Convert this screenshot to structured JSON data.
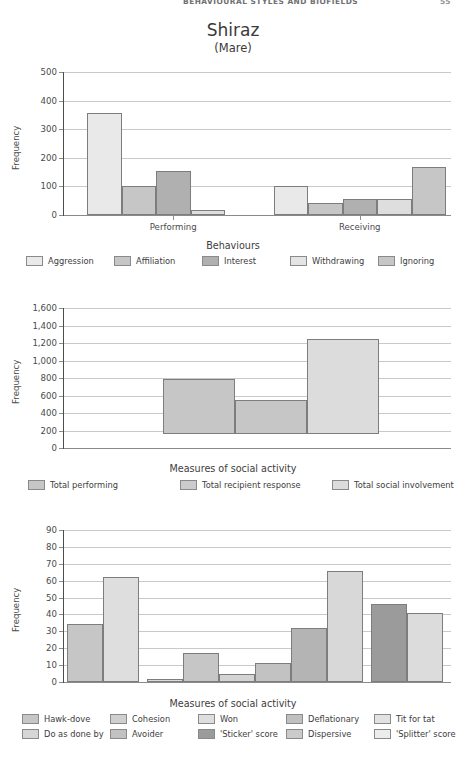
{
  "running_head": {
    "title": "BEHAVIOURAL STYLES AND BIOFIELDS",
    "page_number": "55"
  },
  "figure": {
    "title": "Shiraz",
    "subtitle": "(Mare)"
  },
  "palette": {
    "c1": "#e9e9e9",
    "c2": "#c6c6c6",
    "c3": "#b0b0b0",
    "c4": "#dedede",
    "c5": "#cfcfcf",
    "c6": "#9b9b9b",
    "axis": "#4d4d4d",
    "grid": "#c9c9c9"
  },
  "chart_data": [
    {
      "id": "chart-behaviours",
      "type": "bar",
      "title": "",
      "xlabel": "Behaviours",
      "ylabel": "Frequency",
      "ylim": [
        0,
        500
      ],
      "yticks": [
        0,
        100,
        200,
        300,
        400,
        500
      ],
      "ytick_labels": [
        "0",
        "100",
        "200",
        "300",
        "400",
        "500"
      ],
      "grid": true,
      "legend_position": "bottom",
      "categories": [
        "Performing",
        "Receiving"
      ],
      "series": [
        {
          "name": "Aggression",
          "color": "#e9e9e9",
          "values": [
            358,
            100
          ]
        },
        {
          "name": "Affiliation",
          "color": "#c6c6c6",
          "values": [
            100,
            42
          ]
        },
        {
          "name": "Interest",
          "color": "#b0b0b0",
          "values": [
            155,
            55
          ]
        },
        {
          "name": "Withdrawing",
          "color": "#dedede",
          "values": [
            18,
            57
          ]
        },
        {
          "name": "Ignoring",
          "color": "#c6c6c6",
          "values": [
            0,
            167
          ]
        }
      ]
    },
    {
      "id": "chart-social-activity-totals",
      "type": "bar",
      "title": "",
      "xlabel": "Measures of social activity",
      "ylabel": "Frequency",
      "ylim": [
        0,
        1600
      ],
      "yticks": [
        0,
        200,
        400,
        600,
        800,
        1000,
        1200,
        1400,
        1600
      ],
      "ytick_labels": [
        "0",
        "200",
        "400",
        "600",
        "800",
        "1,000",
        "1,200",
        "1,400",
        "1,600"
      ],
      "grid": true,
      "legend_position": "bottom",
      "categories": [
        "Total performing",
        "Total recipient response",
        "Total social involvement"
      ],
      "bar_base": 160,
      "values": [
        790,
        550,
        1250
      ],
      "colors": [
        "#c6c6c6",
        "#c6c6c6",
        "#dcdcdc"
      ]
    },
    {
      "id": "chart-social-activity-measures",
      "type": "bar",
      "title": "",
      "xlabel": "Measures of social activity",
      "ylabel": "Frequency",
      "ylim": [
        0,
        90
      ],
      "yticks": [
        0,
        10,
        20,
        30,
        40,
        50,
        60,
        70,
        80,
        90
      ],
      "ytick_labels": [
        "0",
        "10",
        "20",
        "30",
        "40",
        "50",
        "60",
        "70",
        "80",
        "90"
      ],
      "grid": true,
      "legend_position": "bottom",
      "categories": [
        "Hawk-dove",
        "Cohesion",
        "Won",
        "Deflationary",
        "Tit for tat",
        "Do as done by",
        "Avoider",
        "'Sticker' score",
        "Dispersive",
        "'Splitter' score"
      ],
      "values": [
        34.5,
        62,
        2,
        17,
        5,
        11,
        32,
        66,
        46,
        41
      ],
      "colors": [
        "#c6c6c6",
        "#dedede",
        "#dcdcdc",
        "#c6c6c6",
        "#d4d4d4",
        "#c2c2c2",
        "#b4b4b4",
        "#d8d8d8",
        "#9b9b9b",
        "#dcdcdc"
      ]
    }
  ],
  "legends": {
    "chart1": [
      {
        "label": "Aggression",
        "color": "#e9e9e9"
      },
      {
        "label": "Affiliation",
        "color": "#c6c6c6"
      },
      {
        "label": "Interest",
        "color": "#b0b0b0"
      },
      {
        "label": "Withdrawing",
        "color": "#e4e4e4"
      },
      {
        "label": "Ignoring",
        "color": "#c6c6c6"
      }
    ],
    "chart2": [
      {
        "label": "Total performing",
        "color": "#c6c6c6"
      },
      {
        "label": "Total recipient response",
        "color": "#cccccc"
      },
      {
        "label": "Total social involvement",
        "color": "#dcdcdc"
      }
    ],
    "chart3": [
      {
        "label": "Hawk-dove",
        "color": "#c6c6c6"
      },
      {
        "label": "Cohesion",
        "color": "#cfcfcf"
      },
      {
        "label": "Won",
        "color": "#dedede"
      },
      {
        "label": "Deflationary",
        "color": "#c0c0c0"
      },
      {
        "label": "Tit for tat",
        "color": "#e2e2e2"
      },
      {
        "label": "Do as done by",
        "color": "#d6d6d6"
      },
      {
        "label": "Avoider",
        "color": "#c2c2c2"
      },
      {
        "label": "'Sticker' score",
        "color": "#9b9b9b"
      },
      {
        "label": "Dispersive",
        "color": "#cbcbcb"
      },
      {
        "label": "'Splitter' score",
        "color": "#ececec"
      }
    ]
  }
}
